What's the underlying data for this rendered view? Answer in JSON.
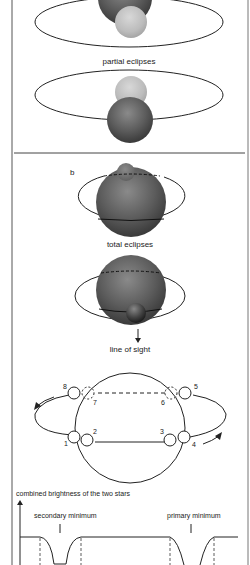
{
  "panel_a": {
    "caption": "partial eclipses"
  },
  "panel_b": {
    "label": "b",
    "caption": "total eclipses",
    "line_of_sight_label": "line of sight"
  },
  "orbit_positions": {
    "labels": [
      "1",
      "2",
      "3",
      "4",
      "5",
      "6",
      "7",
      "8"
    ]
  },
  "light_curve": {
    "y_axis_label": "combined brightness of the two stars",
    "secondary_label": "secondary minimum",
    "primary_label": "primary minimum"
  },
  "colors": {
    "line": "#222222",
    "dark_star": "#5a5a5a",
    "light_star": "#bdbdbd",
    "frame": "#555555"
  }
}
